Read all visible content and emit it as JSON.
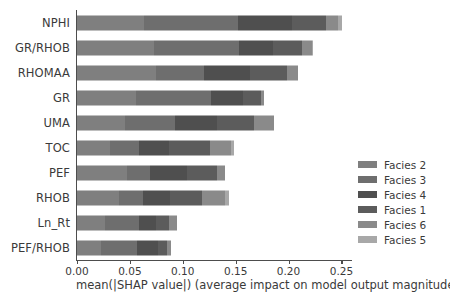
{
  "chart_data": {
    "type": "bar",
    "orientation": "horizontal",
    "stacked": true,
    "title": "",
    "xlabel": "mean(|SHAP value|) (average impact on model output magnitude)",
    "ylabel": "",
    "xlim": [
      0.0,
      0.26
    ],
    "ylim": [
      0,
      10
    ],
    "grid": false,
    "xticks": [
      0.0,
      0.05,
      0.1,
      0.15,
      0.2,
      0.25
    ],
    "xtick_labels": [
      "0.00",
      "0.05",
      "0.10",
      "0.15",
      "0.20",
      "0.25"
    ],
    "categories": [
      "NPHI",
      "GR/RHOB",
      "RHOMAA",
      "GR",
      "UMA",
      "TOC",
      "PEF",
      "RHOB",
      "Ln_Rt",
      "PEF/RHOB"
    ],
    "legend_position": "right",
    "legend": [
      "Facies 2",
      "Facies 3",
      "Facies 4",
      "Facies 1",
      "Facies 6",
      "Facies 5"
    ],
    "series": [
      {
        "name": "Facies 2",
        "color": "#7f7f7f",
        "values": [
          0.0636,
          0.0727,
          0.0745,
          0.0555,
          0.0455,
          0.0309,
          0.0473,
          0.04,
          0.0264,
          0.0227
        ]
      },
      {
        "name": "Facies 3",
        "color": "#6e6e6e",
        "values": [
          0.0882,
          0.08,
          0.0455,
          0.0709,
          0.0473,
          0.0282,
          0.0218,
          0.0227,
          0.0318,
          0.0345
        ]
      },
      {
        "name": "Facies 4",
        "color": "#4f4f4f",
        "values": [
          0.0518,
          0.0327,
          0.0436,
          0.0309,
          0.04,
          0.0282,
          0.0345,
          0.0255,
          0.0164,
          0.0191
        ]
      },
      {
        "name": "Facies 1",
        "color": "#5c5c5c",
        "values": [
          0.0318,
          0.0273,
          0.0345,
          0.0164,
          0.0345,
          0.0382,
          0.0291,
          0.03,
          0.0127,
          0.0091
        ]
      },
      {
        "name": "Facies 6",
        "color": "#8a8a8a",
        "values": [
          0.0118,
          0.0091,
          0.0109,
          0.0036,
          0.0191,
          0.02,
          0.0073,
          0.0218,
          0.0073,
          0.0036
        ]
      },
      {
        "name": "Facies 5",
        "color": "#a8a8a8",
        "values": [
          0.0036,
          0.0009,
          0.0,
          0.0,
          0.0,
          0.0027,
          0.0,
          0.0036,
          0.0,
          0.0
        ]
      }
    ],
    "totals": [
      0.2508,
      0.2227,
      0.209,
      0.1773,
      0.1864,
      0.1482,
      0.14,
      0.1436,
      0.0946,
      0.089
    ],
    "axis_color": "#4d4d4d",
    "background": "#ffffff"
  }
}
